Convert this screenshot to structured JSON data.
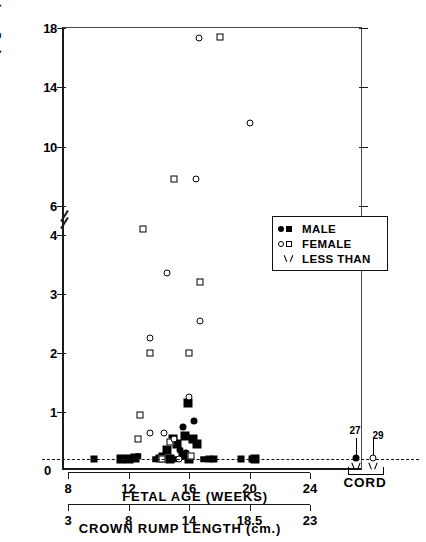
{
  "chart": {
    "type": "scatter",
    "title": "",
    "y_axis_title": "SERUM  FSH  (ng/ml)",
    "x_axis_primary_title": "FETAL  AGE  (WEEKS)",
    "x_axis_secondary_title": "CROWN  RUMP  LENGTH  (cm.)",
    "zero_label": "0"
  },
  "y_ticks_upper": [
    {
      "label": "18",
      "value": 18
    },
    {
      "label": "14",
      "value": 14
    },
    {
      "label": "10",
      "value": 10
    },
    {
      "label": "6",
      "value": 6
    }
  ],
  "y_ticks_lower": [
    {
      "label": "4",
      "value": 4
    },
    {
      "label": "3",
      "value": 3
    },
    {
      "label": "2",
      "value": 2
    },
    {
      "label": "1",
      "value": 1
    }
  ],
  "x_ticks_fetal_age": [
    {
      "label": "8",
      "value": 8
    },
    {
      "label": "12",
      "value": 12
    },
    {
      "label": "16",
      "value": 16
    },
    {
      "label": "20",
      "value": 20
    },
    {
      "label": "24",
      "value": 24
    }
  ],
  "x_ticks_crown_rump": [
    {
      "label": "3",
      "value": 3
    },
    {
      "label": "8",
      "value": 8
    },
    {
      "label": "14",
      "value": 14
    },
    {
      "label": "18.5",
      "value": 18.5
    },
    {
      "label": "23",
      "value": 23
    }
  ],
  "legend": {
    "items": [
      {
        "label": "MALE",
        "symbols": [
          "filled-circle",
          "filled-square"
        ]
      },
      {
        "label": "FEMALE",
        "symbols": [
          "open-circle",
          "open-square"
        ]
      },
      {
        "label": "LESS  THAN",
        "symbols": [
          "less-than-chevron"
        ]
      }
    ]
  },
  "cord": {
    "label": "CORD",
    "points": [
      {
        "id": "27",
        "sex": "male",
        "marker": "filled-circle",
        "less_than": true
      },
      {
        "id": "29",
        "sex": "female",
        "marker": "open-circle",
        "less_than": true
      }
    ]
  },
  "detection_limit": {
    "value": 0.2,
    "style": "dashed"
  },
  "chart_data": {
    "type": "scatter",
    "title": "",
    "xlabel": "FETAL AGE (WEEKS)",
    "xlabel_secondary": "CROWN RUMP LENGTH (cm.)",
    "ylabel": "SERUM FSH (ng/ml)",
    "xlim": [
      7,
      25
    ],
    "ylim": [
      0,
      18
    ],
    "y_axis_break": [
      4.5,
      5.5
    ],
    "grid": false,
    "legend_position": "right-middle",
    "detection_limit": 0.2,
    "series": [
      {
        "name": "MALE",
        "marker": "filled",
        "points": [
          {
            "x": 9.6,
            "y": 0.2
          },
          {
            "x": 11.4,
            "y": 0.2
          },
          {
            "x": 11.9,
            "y": 0.2
          },
          {
            "x": 12.3,
            "y": 0.22
          },
          {
            "x": 12.5,
            "y": 0.25
          },
          {
            "x": 13.6,
            "y": 0.2
          },
          {
            "x": 13.8,
            "y": 0.2
          },
          {
            "x": 13.9,
            "y": 0.22
          },
          {
            "x": 14.0,
            "y": 0.2
          },
          {
            "x": 14.1,
            "y": 0.25
          },
          {
            "x": 14.2,
            "y": 0.2
          },
          {
            "x": 14.4,
            "y": 0.35
          },
          {
            "x": 14.6,
            "y": 0.2
          },
          {
            "x": 14.8,
            "y": 0.55
          },
          {
            "x": 15.0,
            "y": 0.2
          },
          {
            "x": 15.1,
            "y": 0.45
          },
          {
            "x": 15.3,
            "y": 0.35
          },
          {
            "x": 15.4,
            "y": 0.25
          },
          {
            "x": 15.5,
            "y": 0.75
          },
          {
            "x": 15.6,
            "y": 0.6
          },
          {
            "x": 15.7,
            "y": 0.3
          },
          {
            "x": 15.8,
            "y": 1.15
          },
          {
            "x": 15.9,
            "y": 0.2
          },
          {
            "x": 16.1,
            "y": 0.55
          },
          {
            "x": 16.2,
            "y": 0.85
          },
          {
            "x": 16.4,
            "y": 0.45
          },
          {
            "x": 16.8,
            "y": 0.2
          },
          {
            "x": 17.2,
            "y": 0.2
          },
          {
            "x": 17.5,
            "y": 0.2
          },
          {
            "x": 19.3,
            "y": 0.2
          },
          {
            "x": 20.0,
            "y": 0.2
          },
          {
            "x": 20.2,
            "y": 0.2
          }
        ]
      },
      {
        "name": "FEMALE",
        "marker": "open",
        "points": [
          {
            "x": 16.5,
            "y": 17.3
          },
          {
            "x": 17.9,
            "y": 17.4
          },
          {
            "x": 19.9,
            "y": 11.6
          },
          {
            "x": 14.9,
            "y": 7.8
          },
          {
            "x": 16.3,
            "y": 7.8
          },
          {
            "x": 12.8,
            "y": 4.1
          },
          {
            "x": 14.4,
            "y": 3.35
          },
          {
            "x": 16.6,
            "y": 3.2
          },
          {
            "x": 16.6,
            "y": 2.55
          },
          {
            "x": 15.9,
            "y": 2.0
          },
          {
            "x": 13.3,
            "y": 2.25
          },
          {
            "x": 13.3,
            "y": 2.0
          },
          {
            "x": 15.9,
            "y": 1.25
          },
          {
            "x": 12.6,
            "y": 0.95
          },
          {
            "x": 13.3,
            "y": 0.65
          },
          {
            "x": 12.5,
            "y": 0.55
          },
          {
            "x": 14.2,
            "y": 0.65
          },
          {
            "x": 14.6,
            "y": 0.5
          },
          {
            "x": 14.9,
            "y": 0.55
          },
          {
            "x": 14.1,
            "y": 0.2
          },
          {
            "x": 15.2,
            "y": 0.2
          },
          {
            "x": 16.0,
            "y": 0.25
          }
        ]
      }
    ],
    "cord_samples": [
      {
        "label": "27",
        "sex": "male",
        "y": 0.2,
        "less_than": true
      },
      {
        "label": "29",
        "sex": "female",
        "y": 0.2,
        "less_than": true
      }
    ]
  }
}
